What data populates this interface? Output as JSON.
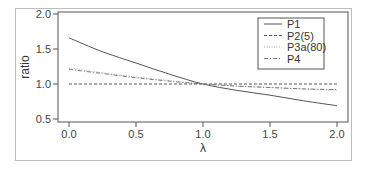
{
  "chart_data": {
    "type": "line",
    "title": "",
    "xlabel": "λ",
    "ylabel": "ratio",
    "xlim": [
      0.0,
      2.0
    ],
    "ylim": [
      0.5,
      2.0
    ],
    "x_ticks": [
      "0.0",
      "0.5",
      "1.0",
      "1.5",
      "2.0"
    ],
    "y_ticks": [
      "0.5",
      "1.0",
      "1.5",
      "2.0"
    ],
    "grid": false,
    "legend_position": "top-right",
    "x": [
      0.0,
      0.25,
      0.5,
      0.75,
      1.0,
      1.25,
      1.5,
      1.75,
      2.0
    ],
    "series": [
      {
        "name": "P1",
        "style": "solid",
        "color": "#555555",
        "values": [
          1.66,
          1.46,
          1.3,
          1.14,
          1.0,
          0.91,
          0.84,
          0.76,
          0.69
        ]
      },
      {
        "name": "P2(5)",
        "style": "dashed",
        "color": "#555555",
        "values": [
          1.0,
          1.0,
          1.0,
          1.0,
          1.0,
          1.0,
          1.0,
          1.0,
          1.0
        ]
      },
      {
        "name": "P3a(80)",
        "style": "dotted",
        "color": "#aaaaaa",
        "values": [
          1.23,
          1.16,
          1.1,
          1.05,
          1.0,
          0.97,
          0.95,
          0.93,
          0.91
        ]
      },
      {
        "name": "P4",
        "style": "dashdot",
        "color": "#777777",
        "values": [
          1.21,
          1.15,
          1.09,
          1.04,
          1.0,
          0.97,
          0.95,
          0.93,
          0.92
        ]
      }
    ]
  }
}
